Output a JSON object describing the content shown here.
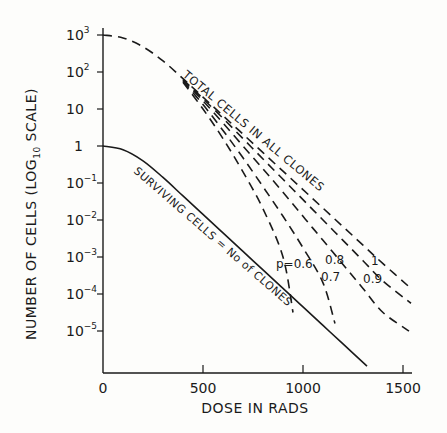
{
  "chart_data": {
    "type": "line",
    "title": "",
    "xlabel": "DOSE IN RADS",
    "ylabel": "NUMBER OF CELLS (LOG10 SCALE)",
    "ylabel_parts": {
      "main": "NUMBER OF CELLS (LOG",
      "sub": "10",
      "end": " SCALE)"
    },
    "xlim": [
      0,
      1600
    ],
    "ylim_log10": [
      -6.1,
      3.2
    ],
    "x_ticks": [
      0,
      500,
      1000,
      1500
    ],
    "x_tick_labels": [
      "0",
      "500",
      "1000",
      "1500"
    ],
    "y_ticks_log10": [
      3,
      2,
      1,
      0,
      -1,
      -2,
      -3,
      -4,
      -5
    ],
    "y_tick_labels": [
      {
        "base": "10",
        "exp": "3"
      },
      {
        "base": "10",
        "exp": "2"
      },
      {
        "base": "10",
        "exp": ""
      },
      {
        "base": "1",
        "exp": ""
      },
      {
        "base": "10",
        "exp": "-1"
      },
      {
        "base": "10",
        "exp": "-2"
      },
      {
        "base": "10",
        "exp": "-3"
      },
      {
        "base": "10",
        "exp": "-4"
      },
      {
        "base": "10",
        "exp": "-5"
      }
    ],
    "grid": false,
    "series": [
      {
        "name": "SURVIVING CELLS = No of CLONES",
        "style": "solid",
        "x": [
          0,
          100,
          200,
          300,
          400,
          500,
          600,
          700,
          800,
          900,
          1000,
          1100,
          1200,
          1320
        ],
        "log10_y": [
          0,
          -0.1,
          -0.4,
          -0.85,
          -1.35,
          -1.85,
          -2.35,
          -2.85,
          -3.35,
          -3.85,
          -4.35,
          -4.85,
          -5.35,
          -5.95
        ]
      },
      {
        "name": "TOTAL CELLS IN ALL CLONES (p=1)",
        "p": 1,
        "style": "dashed",
        "x": [
          0,
          100,
          200,
          300,
          400,
          500,
          600,
          700,
          800,
          900,
          1000,
          1100,
          1200,
          1300,
          1400,
          1540
        ],
        "log10_y": [
          3,
          2.92,
          2.68,
          2.3,
          1.82,
          1.32,
          0.82,
          0.32,
          -0.18,
          -0.68,
          -1.18,
          -1.68,
          -2.18,
          -2.68,
          -3.18,
          -3.85
        ]
      },
      {
        "name": "p=0.9",
        "p": 0.9,
        "style": "dashed",
        "x": [
          400,
          500,
          600,
          700,
          800,
          900,
          1000,
          1100,
          1200,
          1300,
          1400,
          1540
        ],
        "log10_y": [
          1.8,
          1.28,
          0.75,
          0.2,
          -0.35,
          -0.9,
          -1.45,
          -2.0,
          -2.55,
          -3.1,
          -3.65,
          -4.25
        ]
      },
      {
        "name": "p=0.8",
        "p": 0.8,
        "style": "dashed",
        "x": [
          400,
          500,
          600,
          700,
          800,
          900,
          1000,
          1100,
          1200,
          1300,
          1400,
          1530
        ],
        "log10_y": [
          1.78,
          1.22,
          0.62,
          0.0,
          -0.62,
          -1.25,
          -1.9,
          -2.55,
          -3.2,
          -3.85,
          -4.5,
          -5.0
        ]
      },
      {
        "name": "p=0.7",
        "p": 0.7,
        "style": "dashed",
        "x": [
          400,
          500,
          600,
          700,
          800,
          900,
          1000,
          1100,
          1160
        ],
        "log10_y": [
          1.75,
          1.12,
          0.42,
          -0.32,
          -1.1,
          -1.9,
          -2.75,
          -3.7,
          -4.8
        ]
      },
      {
        "name": "p=0.6",
        "p": 0.6,
        "style": "dashed",
        "x": [
          400,
          500,
          600,
          700,
          800,
          900,
          950
        ],
        "log10_y": [
          1.72,
          1.0,
          0.2,
          -0.7,
          -1.7,
          -3.0,
          -4.5
        ]
      }
    ],
    "annotations": [
      {
        "text": "TOTAL CELLS IN ALL CLONES",
        "rotation_deg": 40
      },
      {
        "text": "SURVIVING CELLS = No of CLONES",
        "rotation_deg": 40
      },
      {
        "text": "p=0.6"
      },
      {
        "text": "0.7"
      },
      {
        "text": "0.8"
      },
      {
        "text": "0.9"
      },
      {
        "text": "1"
      }
    ],
    "legend": null
  },
  "labels": {
    "total_cells": "TOTAL CELLS IN ALL CLONES",
    "surviving_cells": "SURVIVING CELLS = No of CLONES",
    "p06": "p=0.6",
    "p07": "0.7",
    "p08": "0.8",
    "p09": "0.9",
    "p1": "1"
  }
}
